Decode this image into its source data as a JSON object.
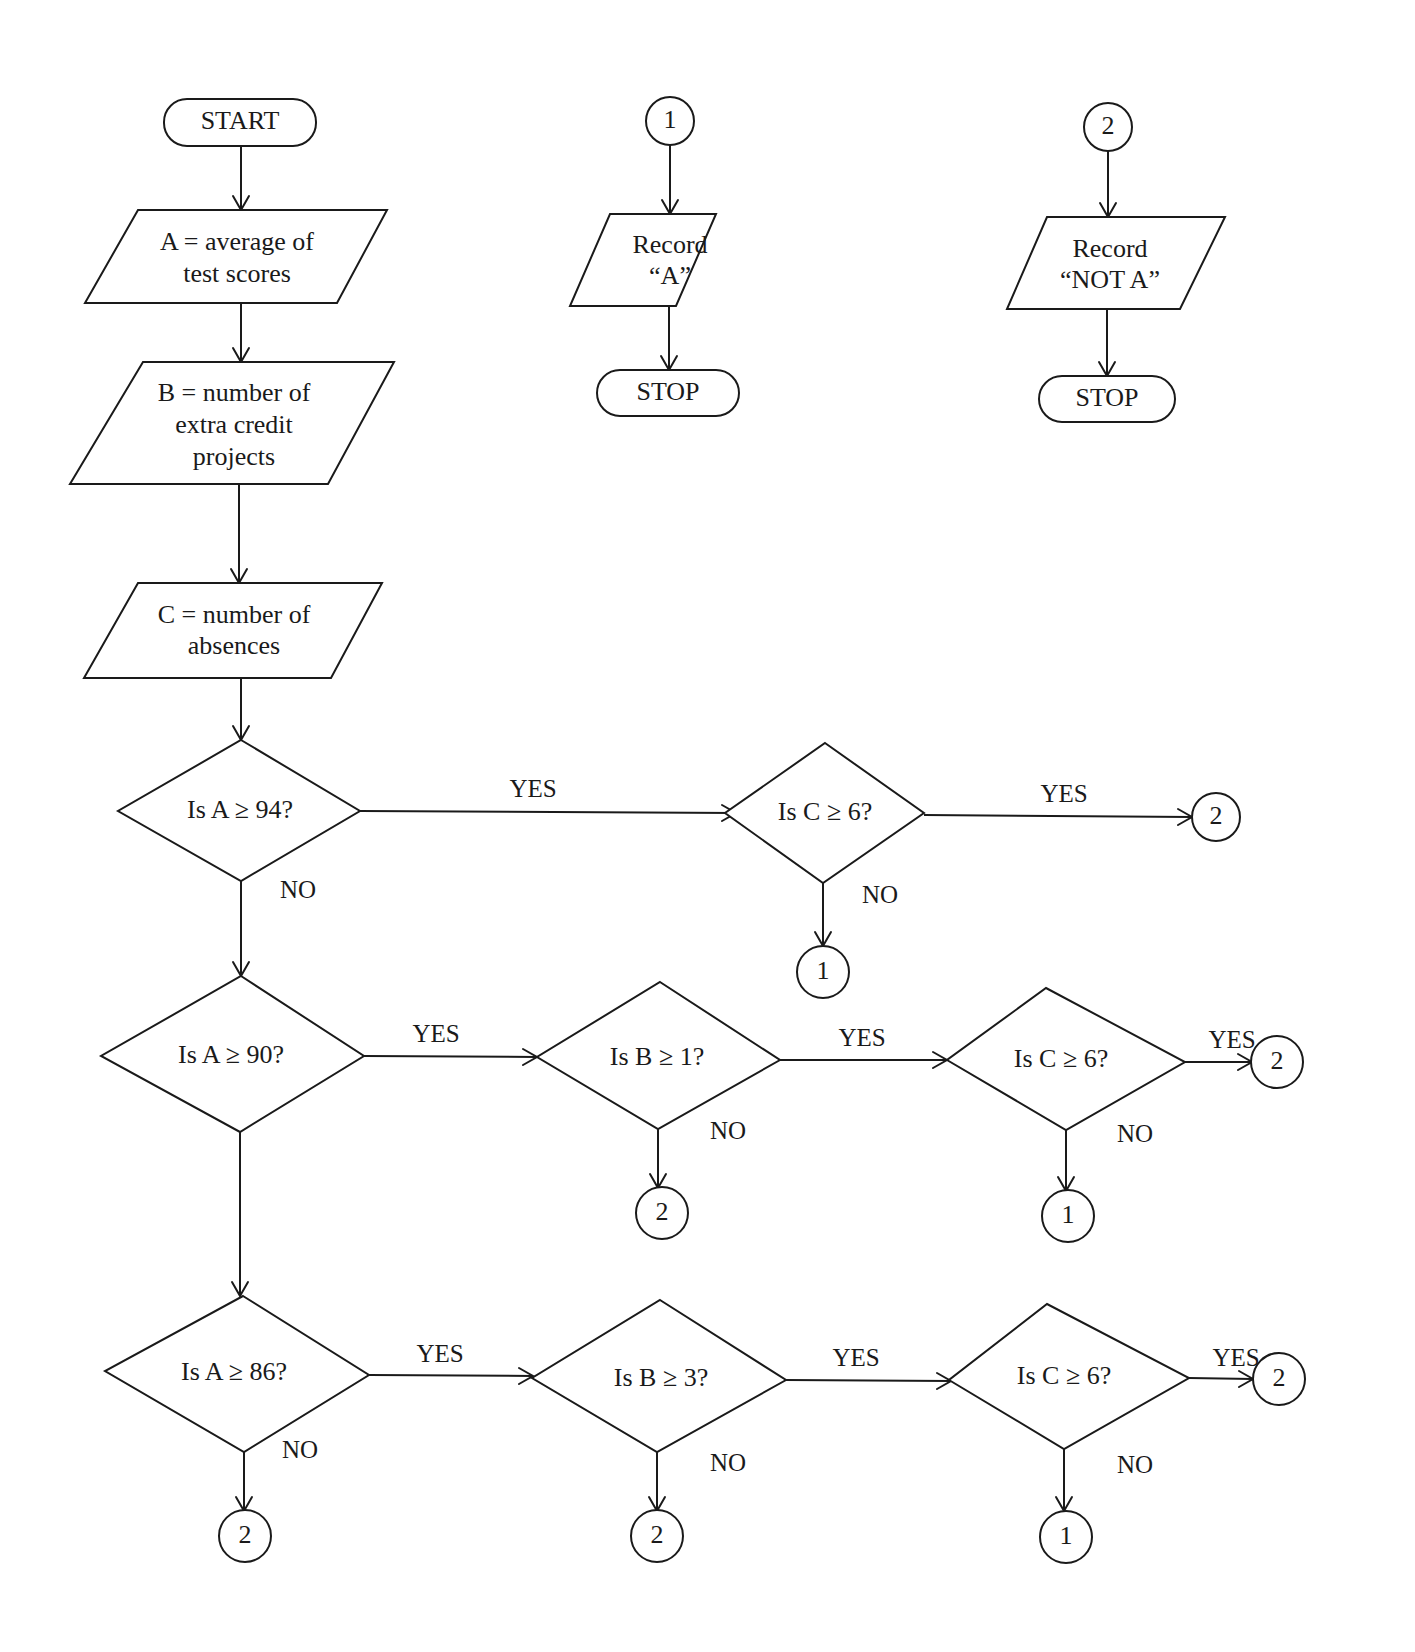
{
  "header_fragment": "Section 3",
  "terminals": {
    "start": "START",
    "stop_a": "STOP",
    "stop_not_a": "STOP"
  },
  "inputs": {
    "a_line1": "A  =  average of",
    "a_line2": "test scores",
    "b_line1": "B  =  number of",
    "b_line2": "extra credit",
    "b_line3": "projects",
    "c_line1": "C  =  number of",
    "c_line2": "absences"
  },
  "outputs": {
    "record_a_line1": "Record",
    "record_a_line2": "“A”",
    "record_not_a_line1": "Record",
    "record_not_a_line2": "“NOT A”"
  },
  "decisions": {
    "a94": "Is  A  ≥  94?",
    "c6_row1": "Is C  ≥  6?",
    "a90": "Is  A  ≥  90?",
    "b1": "Is  B  ≥  1?",
    "c6_row2": "Is  C  ≥  6?",
    "a86": "Is  A  ≥  86?",
    "b3": "Is  B  ≥  3?",
    "c6_row3": "Is  C  ≥  6?"
  },
  "connectors": {
    "top_1": "1",
    "top_2": "2",
    "r1_yes": "2",
    "r1_no": "1",
    "r2_b_no": "2",
    "r2_c_yes": "2",
    "r2_c_no": "1",
    "r3_a_no": "2",
    "r3_b_no": "2",
    "r3_c_yes": "2",
    "r3_c_no": "1"
  },
  "edge_labels": {
    "yes": "YES",
    "no": "NO"
  }
}
